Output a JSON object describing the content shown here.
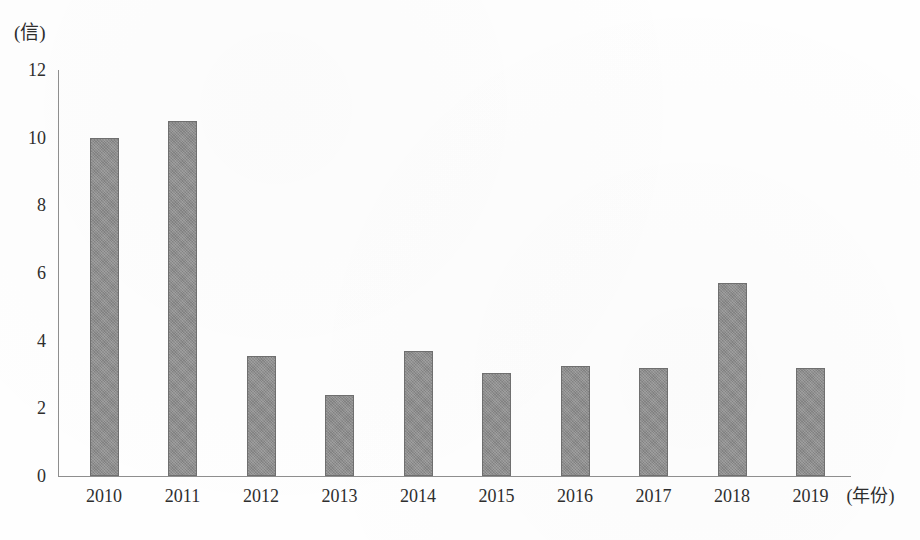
{
  "chart_data": {
    "type": "bar",
    "title": "",
    "subtitle": "",
    "xlabel": "(年份)",
    "ylabel": "(信)",
    "y_unit_label": "(信)",
    "x_unit_label": "(年份)",
    "categories": [
      "2010",
      "2011",
      "2012",
      "2013",
      "2014",
      "2015",
      "2016",
      "2017",
      "2018",
      "2019"
    ],
    "values": [
      10.0,
      10.5,
      3.55,
      2.4,
      3.7,
      3.05,
      3.25,
      3.2,
      5.7,
      3.2
    ],
    "series": [
      {
        "name": "",
        "values": [
          10.0,
          10.5,
          3.55,
          2.4,
          3.7,
          3.05,
          3.25,
          3.2,
          5.7,
          3.2
        ]
      }
    ],
    "ylim": [
      0,
      12
    ],
    "xlim": [
      0,
      10
    ],
    "y_ticks": [
      0,
      2,
      4,
      6,
      8,
      10,
      12
    ],
    "y_tick_labels": [
      "0",
      "2",
      "4",
      "6",
      "8",
      "10",
      "12"
    ],
    "x_tick_labels": [
      "2010",
      "2011",
      "2012",
      "2013",
      "2014",
      "2015",
      "2016",
      "2017",
      "2018",
      "2019"
    ],
    "grid": false,
    "legend": false,
    "legend_position": "none",
    "bar_color": "#8b8b8b",
    "bar_edge_color": "#6f6f6f",
    "axis_color": "#8e8e8e",
    "text_color": "#2e2e2e",
    "background_color": "#ffffff",
    "annotations": []
  }
}
